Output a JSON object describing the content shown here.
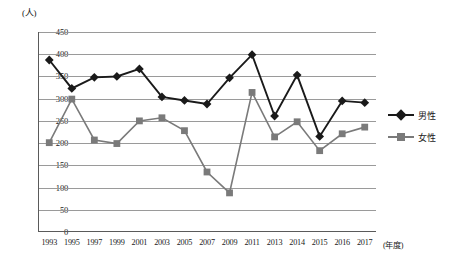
{
  "chart_data": {
    "type": "line",
    "title": "",
    "xlabel": "年度",
    "ylabel": "人",
    "ylim": [
      0,
      450
    ],
    "ytick_step": 50,
    "yticks": [
      "450",
      "400",
      "350",
      "300",
      "250",
      "200",
      "150",
      "100",
      "50",
      "0"
    ],
    "grid": true,
    "legend_position": "right",
    "categories": [
      "1993",
      "1995",
      "1997",
      "1999",
      "2001",
      "2003",
      "2005",
      "2007",
      "2009",
      "2011",
      "2013",
      "2014",
      "2015",
      "2016",
      "2017"
    ],
    "series": [
      {
        "name": "男性",
        "color": "#1a1a1a",
        "marker": "diamond",
        "values": [
          387,
          323,
          348,
          350,
          367,
          304,
          296,
          288,
          347,
          399,
          261,
          353,
          215,
          295,
          291
        ]
      },
      {
        "name": "女性",
        "color": "#7a7a7a",
        "marker": "square",
        "values": [
          201,
          299,
          207,
          199,
          250,
          257,
          228,
          135,
          88,
          314,
          214,
          248,
          183,
          221,
          236
        ]
      }
    ]
  },
  "axis": {
    "y_unit_label": "(人)",
    "x_unit_label": "(年度)"
  },
  "colors": {
    "male_series": "#1a1a1a",
    "female_series": "#7a7a7a",
    "gridline": "#9a9a9a",
    "axis": "#5a5a5a",
    "background": "#ffffff"
  }
}
